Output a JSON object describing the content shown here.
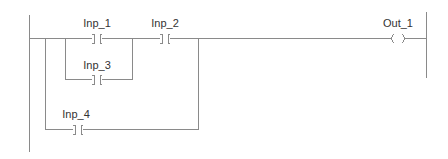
{
  "diagram": {
    "type": "ladder-logic",
    "colors": {
      "line": "#8a8a8a",
      "text": "#333333",
      "background": "#ffffff"
    },
    "contacts": [
      {
        "id": "inp1",
        "label": "Inp_1",
        "kind": "normally-open"
      },
      {
        "id": "inp2",
        "label": "Inp_2",
        "kind": "normally-open"
      },
      {
        "id": "inp3",
        "label": "Inp_3",
        "kind": "normally-open"
      },
      {
        "id": "inp4",
        "label": "Inp_4",
        "kind": "normally-open"
      }
    ],
    "coils": [
      {
        "id": "out1",
        "label": "Out_1",
        "kind": "output-coil"
      }
    ],
    "logic": "((Inp_1 OR Inp_3) AND Inp_2) OR Inp_4 -> Out_1"
  }
}
